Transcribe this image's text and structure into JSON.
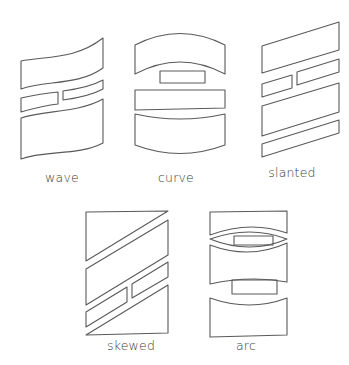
{
  "diagram": {
    "stroke_color": "#5a5a5a",
    "label_color": "#3a3a3a",
    "figures": [
      {
        "id": "wave",
        "label": "wave",
        "label_pos": [
          62,
          182
        ],
        "shapes": [
          {
            "name": "wave-top-panel",
            "d": "M 21 61 C 45 56, 75 60, 103 38 L 103 68 C 78 86, 45 80, 21 89 Z"
          },
          {
            "name": "wave-middle-left-box",
            "d": "M 21 98 C 35 95, 48 93, 58 92 L 58 104 C 48 105, 35 108, 21 112 Z"
          },
          {
            "name": "wave-middle-right-box",
            "d": "M 63 91 C 78 89, 92 86, 103 80 L 103 89 C 92 95, 78 98, 63 100 Z"
          },
          {
            "name": "wave-bottom-panel",
            "d": "M 21 118 C 45 110, 78 113, 103 99 L 103 143 C 78 156, 45 150, 21 159 Z"
          }
        ]
      },
      {
        "id": "curve",
        "label": "curve",
        "label_pos": [
          176,
          182
        ],
        "shapes": [
          {
            "name": "curve-top-panel",
            "d": "M 135 45 Q 180 22 225 45 L 225 74 Q 180 50 135 74 Z"
          },
          {
            "name": "curve-inner-box",
            "d": "M 160 71 L 205 71 L 205 83 L 160 83 Z"
          },
          {
            "name": "curve-middle-panel",
            "d": "M 135 90 L 225 90 L 225 108 L 135 110 Z"
          },
          {
            "name": "curve-bottom-panel",
            "d": "M 135 114 Q 180 124 225 114 L 225 145 Q 180 162 135 145 Z"
          }
        ]
      },
      {
        "id": "slanted",
        "label": "slanted",
        "label_pos": [
          292,
          177
        ],
        "shapes": [
          {
            "name": "slanted-top-panel",
            "d": "M 262 46 L 339 22 L 339 50 L 262 73 Z"
          },
          {
            "name": "slanted-middle-left-box",
            "d": "M 262 84 L 292 75 L 292 88 L 262 97 Z"
          },
          {
            "name": "slanted-middle-right-box",
            "d": "M 297 72 L 339 59 L 339 72 L 297 85 Z"
          },
          {
            "name": "slanted-third-panel",
            "d": "M 262 106 L 339 83 L 339 112 L 262 136 Z"
          },
          {
            "name": "slanted-bottom-panel",
            "d": "M 262 144 L 339 120 L 339 133 L 262 157 Z"
          }
        ]
      },
      {
        "id": "skewed",
        "label": "skewed",
        "label_pos": [
          131,
          350
        ],
        "shapes": [
          {
            "name": "skewed-top-triangle-panel",
            "d": "M 86 212 L 168 211 L 86 261 Z"
          },
          {
            "name": "skewed-second-panel",
            "d": "M 86 269 L 168 220 L 168 255 L 86 305 Z"
          },
          {
            "name": "skewed-middle-left-box",
            "d": "M 86 312 L 127 287 L 127 302 L 86 327 Z"
          },
          {
            "name": "skewed-middle-right-box",
            "d": "M 132 284 L 168 262 L 168 277 L 132 298 Z"
          },
          {
            "name": "skewed-bottom-triangle-panel",
            "d": "M 86 335 L 168 285 L 168 333 Z"
          }
        ]
      },
      {
        "id": "arc",
        "label": "arc",
        "label_pos": [
          246,
          350
        ],
        "shapes": [
          {
            "name": "arc-top-panel",
            "d": "M 210 212 L 287 211 L 287 233 Q 250 220 210 235 Z"
          },
          {
            "name": "arc-first-lens",
            "d": "M 210 239 Q 250 255 287 239 Q 250 225 210 239 Z"
          },
          {
            "name": "arc-first-inner-box",
            "d": "M 234 236 L 273 236 L 273 245 L 234 245 Z"
          },
          {
            "name": "arc-middle-panel",
            "d": "M 210 245 Q 250 260 287 243 L 287 282 Q 250 275 210 284 Z"
          },
          {
            "name": "arc-second-inner-box",
            "d": "M 232 280 L 277 280 L 277 294 L 232 294 Z"
          },
          {
            "name": "arc-bottom-panel",
            "d": "M 210 298 Q 250 312 287 298 L 287 335 L 210 337 Z"
          }
        ]
      }
    ]
  }
}
